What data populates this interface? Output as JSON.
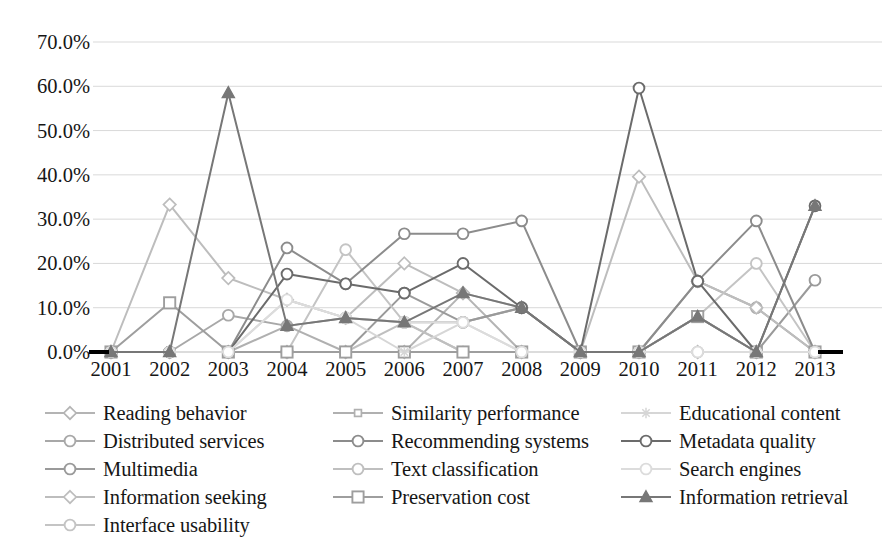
{
  "chart_data": {
    "type": "line",
    "title": "",
    "subtitle": "",
    "xlabel": "",
    "ylabel": "",
    "categories": [
      "2001",
      "2002",
      "2003",
      "2004",
      "2005",
      "2006",
      "2007",
      "2008",
      "2009",
      "2010",
      "2011",
      "2012",
      "2013"
    ],
    "ylim": [
      0,
      70
    ],
    "y_tick_step": 10,
    "y_tick_labels": [
      "0.0%",
      "10.0%",
      "20.0%",
      "30.0%",
      "40.0%",
      "50.0%",
      "60.0%",
      "70.0%"
    ],
    "y_tick_values": [
      0,
      10,
      20,
      30,
      40,
      50,
      60,
      70
    ],
    "grid": true,
    "grid_axis": "y",
    "legend_position": "bottom",
    "legend_columns": 3,
    "value_unit": "percent",
    "series": [
      {
        "name": "Reading behavior",
        "marker": "diamond",
        "color": "#b4b4b4",
        "values": [
          0.0,
          0.0,
          0.0,
          0.0,
          0.0,
          0.0,
          13.3,
          0.0,
          0.0,
          0.0,
          0.0,
          0.0,
          0.0
        ]
      },
      {
        "name": "Distributed services",
        "marker": "circle",
        "color": "#a8a8a8",
        "values": [
          0.0,
          0.0,
          8.3,
          5.9,
          7.7,
          6.7,
          6.7,
          10.0,
          0.0,
          0.0,
          16.0,
          10.0,
          0.0
        ]
      },
      {
        "name": "Multimedia",
        "marker": "circle",
        "color": "#9a9a9a",
        "values": [
          0.0,
          0.0,
          0.0,
          0.0,
          0.0,
          13.3,
          6.7,
          10.0,
          0.0,
          0.0,
          8.0,
          0.0,
          16.2
        ]
      },
      {
        "name": "Information seeking",
        "marker": "diamond",
        "color": "#bdbdbd",
        "values": [
          0.0,
          33.3,
          16.7,
          11.8,
          7.7,
          20.0,
          13.3,
          10.0,
          0.0,
          39.6,
          16.0,
          10.0,
          0.0
        ]
      },
      {
        "name": "Interface usability",
        "marker": "circle",
        "color": "#c4c4c4",
        "values": [
          0.0,
          0.0,
          0.0,
          0.0,
          23.1,
          6.7,
          0.0,
          0.0,
          0.0,
          0.0,
          8.0,
          20.0,
          0.0
        ]
      },
      {
        "name": "Similarity performance",
        "marker": "small-square",
        "color": "#b0b0b0",
        "values": [
          0.0,
          0.0,
          0.0,
          5.9,
          0.0,
          0.0,
          0.0,
          0.0,
          0.0,
          0.0,
          8.0,
          0.0,
          0.0
        ]
      },
      {
        "name": "Recommending systems",
        "marker": "circle",
        "color": "#8c8c8c",
        "values": [
          0.0,
          0.0,
          0.0,
          23.5,
          15.4,
          26.7,
          26.7,
          29.6,
          0.0,
          0.0,
          16.0,
          29.6,
          0.0
        ]
      },
      {
        "name": "Text classification",
        "marker": "circle",
        "color": "#bfbfbf",
        "values": [
          0.0,
          0.0,
          0.0,
          0.0,
          0.0,
          6.7,
          0.0,
          0.0,
          0.0,
          0.0,
          0.0,
          0.0,
          0.0
        ]
      },
      {
        "name": "Preservation cost",
        "marker": "square",
        "color": "#9e9e9e",
        "values": [
          0.0,
          11.1,
          0.0,
          0.0,
          0.0,
          0.0,
          0.0,
          0.0,
          0.0,
          0.0,
          8.0,
          0.0,
          0.0
        ]
      },
      {
        "name": "Educational content",
        "marker": "star",
        "color": "#d6d6d6",
        "values": [
          0.0,
          0.0,
          0.0,
          11.8,
          7.7,
          0.0,
          6.7,
          0.0,
          0.0,
          0.0,
          0.0,
          0.0,
          0.0
        ]
      },
      {
        "name": "Metadata quality",
        "marker": "circle",
        "color": "#6b6b6b",
        "values": [
          0.0,
          0.0,
          0.0,
          17.6,
          15.4,
          13.3,
          20.0,
          10.0,
          0.0,
          59.6,
          16.0,
          0.0,
          33.0
        ]
      },
      {
        "name": "Search engines",
        "marker": "circle",
        "color": "#dcdcdc",
        "values": [
          0.0,
          0.0,
          0.0,
          11.8,
          7.7,
          6.7,
          6.7,
          0.0,
          0.0,
          0.0,
          0.0,
          0.0,
          0.0
        ]
      },
      {
        "name": "Information retrieval",
        "marker": "triangle",
        "color": "#777777",
        "values": [
          0.0,
          0.0,
          58.5,
          5.9,
          7.7,
          6.7,
          13.3,
          10.0,
          0.0,
          0.0,
          8.0,
          0.0,
          33.0
        ]
      }
    ]
  },
  "legend": {
    "items": [
      {
        "label": "Reading behavior"
      },
      {
        "label": "Similarity performance"
      },
      {
        "label": "Educational content"
      },
      {
        "label": "Distributed services"
      },
      {
        "label": "Recommending systems"
      },
      {
        "label": "Metadata quality"
      },
      {
        "label": "Multimedia"
      },
      {
        "label": "Text classification"
      },
      {
        "label": "Search engines"
      },
      {
        "label": "Information seeking"
      },
      {
        "label": "Preservation cost"
      },
      {
        "label": "Information retrieval"
      },
      {
        "label": "Interface usability"
      }
    ]
  },
  "axis_colors": {
    "gridline": "#d9d9d9",
    "baseline": "#000000",
    "tick_text": "#161616"
  }
}
